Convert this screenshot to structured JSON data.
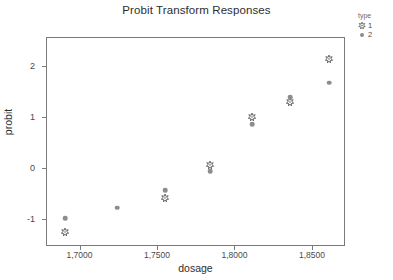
{
  "chart_data": {
    "type": "scatter",
    "title": "Probit Transform Responses",
    "xlabel": "dosage",
    "ylabel": "probit",
    "xlim": [
      1.679,
      1.872
    ],
    "ylim": [
      -1.55,
      2.55
    ],
    "xticks": [
      1.7,
      1.75,
      1.8,
      1.85
    ],
    "xtick_labels": [
      "1,7000",
      "1,7500",
      "1,8000",
      "1,8500"
    ],
    "yticks": [
      2,
      1,
      0,
      -1
    ],
    "ytick_labels": [
      "2",
      "1",
      "0",
      "-1"
    ],
    "grid": false,
    "legend": {
      "title": "type",
      "position": "top-right",
      "entries": [
        {
          "label": "1",
          "marker": "star-marker"
        },
        {
          "label": "2",
          "marker": "circle-marker"
        }
      ]
    },
    "series": [
      {
        "name": "1",
        "marker": "star-marker",
        "color": "#555555",
        "points": [
          {
            "x": 1.6907,
            "y": -1.26
          },
          {
            "x": 1.7552,
            "y": -0.58
          },
          {
            "x": 1.7842,
            "y": 0.06
          },
          {
            "x": 1.8113,
            "y": 1.01
          },
          {
            "x": 1.8361,
            "y": 1.3
          },
          {
            "x": 1.861,
            "y": 2.14
          }
        ]
      },
      {
        "name": "2",
        "marker": "circle-marker",
        "color": "#8d8d8d",
        "points": [
          {
            "x": 1.6907,
            "y": -0.99
          },
          {
            "x": 1.7242,
            "y": -0.78
          },
          {
            "x": 1.7552,
            "y": -0.43
          },
          {
            "x": 1.7842,
            "y": -0.06
          },
          {
            "x": 1.8113,
            "y": 0.86
          },
          {
            "x": 1.8361,
            "y": 1.39
          },
          {
            "x": 1.861,
            "y": 1.67
          }
        ]
      }
    ]
  }
}
